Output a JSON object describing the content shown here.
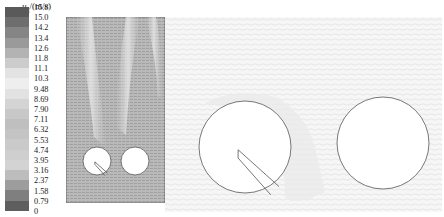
{
  "legend": {
    "variable": "u",
    "subscript": "g",
    "unit": "/(m/s)",
    "ticks": [
      "15.8",
      "15.0",
      "14.2",
      "13.4",
      "12.6",
      "11.8",
      "11.1",
      "10.3",
      "9.48",
      "8.69",
      "7.90",
      "7.11",
      "6.32",
      "5.53",
      "4.74",
      "3.95",
      "3.16",
      "2.37",
      "1.58",
      "0.79",
      "0"
    ],
    "colors": [
      "#5a5a5a",
      "#6e6e6e",
      "#858585",
      "#9a9a9a",
      "#b3b3b3",
      "#cccccc",
      "#e3e3e3",
      "#eeeeee",
      "#e2e2e2",
      "#d4d4d4",
      "#c8c8c8",
      "#bfbfbf",
      "#c4c4c4",
      "#cacaca",
      "#cfcfcf",
      "#d3d3d3",
      "#bdbdbd",
      "#9d9d9d",
      "#7f7f7f",
      "#5e5e5e"
    ]
  },
  "panels": {
    "left": {
      "description": "Gas velocity field around two cylinders, side-by-side, dense vector field",
      "background": "#b8b8b8",
      "cylinders": [
        {
          "cx": 31,
          "cy": 144,
          "r": 14,
          "has_notch": true
        },
        {
          "cx": 69,
          "cy": 144,
          "r": 14,
          "has_notch": false
        }
      ]
    },
    "right": {
      "description": "Zoomed gas velocity vector field around two cylinders",
      "background": "#f4f4f4",
      "cylinders": [
        {
          "cx": 80,
          "cy": 130,
          "r": 46,
          "has_notch": true
        },
        {
          "cx": 218,
          "cy": 126,
          "r": 46,
          "has_notch": false
        }
      ]
    }
  }
}
